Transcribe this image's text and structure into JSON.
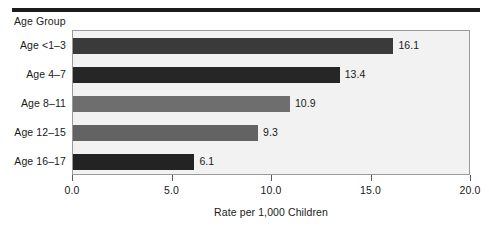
{
  "chart_data": {
    "type": "bar",
    "orientation": "horizontal",
    "title": "",
    "ylabel": "Age Group",
    "xlabel": "Rate per 1,000 Children",
    "categories": [
      "Age <1–3",
      "Age 4–7",
      "Age 8–11",
      "Age 12–15",
      "Age 16–17"
    ],
    "values": [
      16.1,
      13.4,
      10.9,
      9.3,
      6.1
    ],
    "value_labels": [
      "16.1",
      "13.4",
      "10.9",
      "9.3",
      "6.1"
    ],
    "bar_colors": [
      "#3a3a3a",
      "#262626",
      "#6e6e6e",
      "#636363",
      "#232323"
    ],
    "xlim": [
      0.0,
      20.0
    ],
    "xticks": [
      0.0,
      5.0,
      10.0,
      15.0,
      20.0
    ],
    "xtick_labels": [
      "0.0",
      "5.0",
      "10.0",
      "15.0",
      "20.0"
    ],
    "grid": false,
    "legend": false,
    "plot_background": "#f2f2f2",
    "plot_border_color": "#9a9a9a"
  },
  "decor": {
    "top_rule_color": "#1c1c1c"
  }
}
